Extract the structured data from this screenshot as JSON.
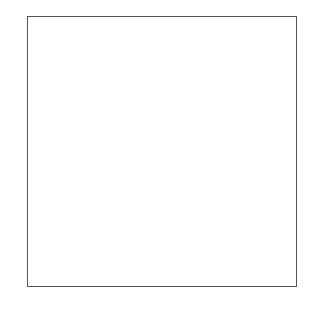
{
  "board": {
    "files": [
      "a",
      "b",
      "c",
      "d",
      "e",
      "f",
      "g",
      "h"
    ],
    "ranks": [
      "8",
      "7",
      "6",
      "5",
      "4",
      "3",
      "2",
      "1"
    ],
    "light_color": "#ffffff",
    "dark_color": "#6e6e6e",
    "pieces": [
      {
        "square": "e5",
        "type": "rook",
        "color": "black",
        "glyph": "♜"
      },
      {
        "square": "g5",
        "type": "king",
        "color": "black",
        "glyph": "♚"
      },
      {
        "square": "e3",
        "type": "pawn",
        "color": "white",
        "glyph": "♙"
      },
      {
        "square": "e2",
        "type": "king",
        "color": "white",
        "glyph": "♔"
      },
      {
        "square": "f2",
        "type": "pawn",
        "color": "white",
        "glyph": "♙"
      }
    ],
    "arrow": {
      "from": "f2",
      "to": "f4",
      "color": "#555555"
    }
  },
  "caption": "..."
}
